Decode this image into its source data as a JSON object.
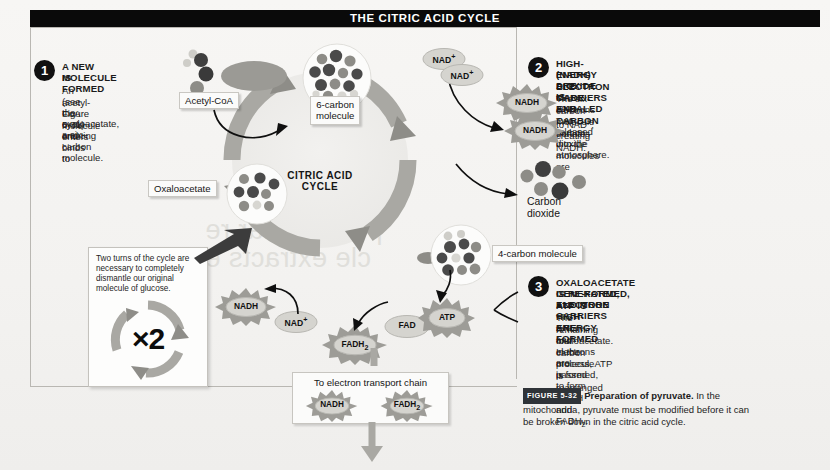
{
  "figure": {
    "title": "THE CITRIC ACID CYCLE",
    "cycle_center_line1": "CITRIC ACID",
    "cycle_center_line2": "CYCLE"
  },
  "steps": [
    {
      "number": "1",
      "heading_line1": "A NEW MOLECULE",
      "heading_line2": "IS FORMED",
      "body_line1": "An acetyl-CoA molecule",
      "body_line2": "(see Figure 5-31) enters",
      "body_line3": "the cycle and binds to",
      "body_line4": "oxaloacetate, creating",
      "body_line5": "a six-carbon molecule."
    },
    {
      "number": "2",
      "heading_line1": "HIGH-ENERGY ELECTRON CARRIERS",
      "heading_line2": "(NADH) ARE MADE AND CARBON",
      "heading_line3": "DIOXIDE IS EXHALED",
      "body_line1": "The six-carbon molecule donates",
      "body_line2_pre": "electrons to NAD",
      "body_line2_sup": "+",
      "body_line2_post": ", creating NADH.",
      "body_line3": "Two carbon dioxide molecules are",
      "body_line4": "released into the atmosphere."
    },
    {
      "number": "3",
      "heading_line1": "OXALOACETATE IS RE-FORMED, ATP IS",
      "heading_line2": "GENERATED, AND MORE HIGH-ENERGY",
      "heading_line3": "ELECTRON CARRIERS ARE FORMED",
      "body_line1": "The remaining four-carbon molecule is rearranged",
      "body_line2": "to form oxaloacetate. In the process, ATP is formed,",
      "body_line3_pre": "and electrons are passed to form NADH and FADH",
      "body_line3_sub": "2",
      "body_line3_post": "."
    }
  ],
  "labels": {
    "acetyl_coa": "Acetyl-CoA",
    "six_carbon_line1": "6-carbon",
    "six_carbon_line2": "molecule",
    "oxaloacetate": "Oxaloacetate",
    "four_carbon": "4-carbon molecule",
    "carbon_dioxide_line1": "Carbon",
    "carbon_dioxide_line2": "dioxide"
  },
  "badges": {
    "nad_plus_top_1": "NAD",
    "nad_plus_top_1_sup": "+",
    "nad_plus_top_2": "NAD",
    "nad_plus_top_2_sup": "+",
    "nadh_top_1": "NADH",
    "nadh_top_2": "NADH",
    "nadh_bottom": "NADH",
    "nad_plus_bottom": "NAD",
    "nad_plus_bottom_sup": "+",
    "fad": "FAD",
    "fadh2": "FADH",
    "fadh2_sub": "2",
    "atp": "ATP",
    "etc_nadh": "NADH",
    "etc_fadh2": "FADH",
    "etc_fadh2_sub": "2"
  },
  "note": {
    "line1": "Two turns of the cycle are",
    "line2": "necessary to completely",
    "line3": "dismantle our original",
    "line4": "molecule of glucose.",
    "multiplier": "×2"
  },
  "etc": {
    "title": "To electron transport chain"
  },
  "caption": {
    "figure_tag": "FIGURE 5-32",
    "bold_text": "Preparation of pyruvate.",
    "rest_line1": " In the",
    "rest_line2": "mitochondria, pyruvate must be modified before it can",
    "rest_line3": "be broken down in the citric acid cycle."
  },
  "bleed_text": {
    "line1": "p of cellular re",
    "line2": "cle extracts e"
  },
  "colors": {
    "title_bar": "#0a0a0a",
    "ring_gray": "#a9a8a3",
    "badge_fill": "#d5d4cf",
    "starburst_fill": "#9d9c97",
    "page_bg": "#f4f3f1",
    "dark_atom": "#4a4a4a",
    "mid_atom": "#8d8c87",
    "light_atom": "#d9d8d3"
  }
}
